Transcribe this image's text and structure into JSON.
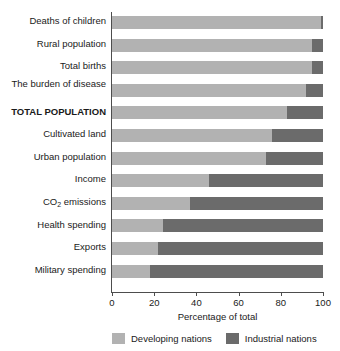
{
  "chart_data": {
    "type": "bar",
    "orientation": "horizontal",
    "stacked": true,
    "stacked_mode": "percent",
    "title": "",
    "xlabel": "Percentage of total",
    "ylabel": "",
    "xlim": [
      0,
      100
    ],
    "xticks": [
      0,
      20,
      40,
      60,
      80,
      100
    ],
    "xticklabels": [
      "0",
      "20",
      "40",
      "60",
      "80",
      "100"
    ],
    "grid": false,
    "legend_position": "bottom",
    "categories": [
      "Deaths of children",
      "Rural population",
      "Total births",
      "The burden of disease",
      "TOTAL POPULATION",
      "Cultivated land",
      "Urban population",
      "Income",
      "CO2 emissions",
      "Health spending",
      "Exports",
      "Military spending"
    ],
    "series": [
      {
        "name": "Developing nations",
        "color": "#b2b2b2",
        "values": [
          99,
          95,
          95,
          92,
          83,
          76,
          73,
          46,
          37,
          24,
          22,
          18
        ]
      },
      {
        "name": "Industrial nations",
        "color": "#6b6b6b",
        "values": [
          1,
          5,
          5,
          8,
          17,
          24,
          27,
          54,
          63,
          76,
          78,
          82
        ]
      }
    ]
  },
  "labels": {
    "rows": [
      {
        "text": "Deaths of children",
        "bold": false,
        "two_line": false
      },
      {
        "text": "Rural population",
        "bold": false,
        "two_line": false
      },
      {
        "text": "Total births",
        "bold": false,
        "two_line": false
      },
      {
        "text": "The burden of disease",
        "bold": false,
        "two_line": true
      },
      {
        "text": "TOTAL POPULATION",
        "bold": true,
        "two_line": false
      },
      {
        "text": "Cultivated land",
        "bold": false,
        "two_line": false
      },
      {
        "text": "Urban population",
        "bold": false,
        "two_line": false
      },
      {
        "text": "Income",
        "bold": false,
        "two_line": false
      },
      {
        "text": "CO2 emissions",
        "bold": false,
        "two_line": false,
        "has_subscript": true,
        "base": "CO",
        "sub": "2",
        "tail": " emissions"
      },
      {
        "text": "Health spending",
        "bold": false,
        "two_line": false
      },
      {
        "text": "Exports",
        "bold": false,
        "two_line": false
      },
      {
        "text": "Military spending",
        "bold": false,
        "two_line": false
      }
    ]
  },
  "axis": {
    "xlabel": "Percentage of total",
    "ticks": [
      "0",
      "20",
      "40",
      "60",
      "80",
      "100"
    ]
  },
  "legend": {
    "items": [
      {
        "label": "Developing nations",
        "color": "#b2b2b2"
      },
      {
        "label": "Industrial nations",
        "color": "#6b6b6b"
      }
    ]
  },
  "colors": {
    "developing": "#b2b2b2",
    "industrial": "#6b6b6b",
    "axis": "#4d4d4d",
    "text": "#1a1a1a",
    "background": "#ffffff"
  }
}
